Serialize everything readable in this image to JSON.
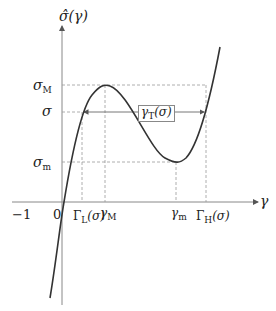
{
  "diagram": {
    "y_axis_label": "σ̂(γ)",
    "x_axis_label": "γ",
    "y_ticks": {
      "sigma_M": {
        "base": "σ",
        "sub": "M"
      },
      "sigma": {
        "base": "σ"
      },
      "sigma_m": {
        "base": "σ",
        "sub": "m"
      }
    },
    "x_ticks": {
      "minus_one": "−1",
      "zero": "0",
      "gamma_L": {
        "base": "Γ",
        "sub": "L",
        "arg": "(σ)"
      },
      "gamma_M": {
        "base": "γ",
        "sub": "M"
      },
      "gamma_m": {
        "base": "γ",
        "sub": "m"
      },
      "gamma_H": {
        "base": "Γ",
        "sub": "H",
        "arg": "(σ)"
      }
    },
    "interval_label": {
      "base": "γ",
      "sub": "T",
      "arg": "(σ)"
    },
    "colors": {
      "curve": "#333333",
      "axis": "#888888",
      "dashed": "#999999"
    }
  }
}
